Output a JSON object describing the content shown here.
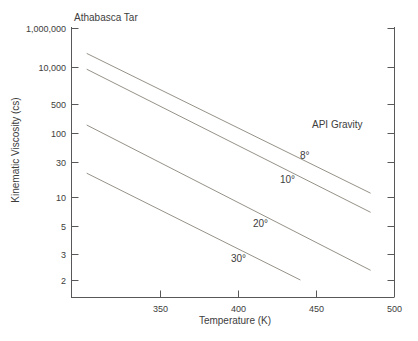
{
  "chart_data": {
    "type": "line",
    "title": "Athabasca Tar",
    "xlabel": "Temperature (K)",
    "ylabel": "Kinematic Viscosity (cs)",
    "legend_title": "API Gravity",
    "x_scale": "linear",
    "y_scale": "double-log ASTM viscosity scale: log10(log10(v+0.7))",
    "xlim": [
      293,
      500
    ],
    "ylim": [
      1.6,
      1000000
    ],
    "grid": false,
    "legend_position": "inline labels on lines, right side of plot",
    "x_ticks": [
      {
        "value": 350,
        "label": "350"
      },
      {
        "value": 400,
        "label": "400"
      },
      {
        "value": 450,
        "label": "450"
      },
      {
        "value": 500,
        "label": "500"
      }
    ],
    "y_ticks": [
      {
        "value": 1000000,
        "label": "1,000,000"
      },
      {
        "value": 10000,
        "label": "10,000"
      },
      {
        "value": 500,
        "label": "500"
      },
      {
        "value": 100,
        "label": "100"
      },
      {
        "value": 30,
        "label": "30"
      },
      {
        "value": 10,
        "label": "10"
      },
      {
        "value": 5,
        "label": "5"
      },
      {
        "value": 3,
        "label": "3"
      },
      {
        "value": 2,
        "label": "2"
      }
    ],
    "series": [
      {
        "name": "api-gravity-8",
        "label": "8°",
        "points": [
          [
            303,
            40000
          ],
          [
            485,
            11
          ]
        ]
      },
      {
        "name": "api-gravity-10",
        "label": "10°",
        "points": [
          [
            303,
            8000
          ],
          [
            485,
            6.8
          ]
        ]
      },
      {
        "name": "api-gravity-20",
        "label": "20°",
        "points": [
          [
            303,
            150
          ],
          [
            485,
            2.3
          ]
        ]
      },
      {
        "name": "api-gravity-30",
        "label": "30°",
        "points": [
          [
            303,
            20
          ],
          [
            440,
            2.0
          ]
        ]
      }
    ],
    "colors": {
      "background": "#ffffff",
      "series_line": "#969288",
      "axis": "#58585a",
      "text": "#3d3d3d"
    }
  }
}
